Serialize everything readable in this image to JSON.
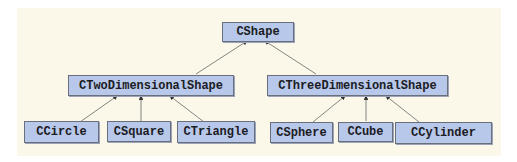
{
  "diagram": {
    "type": "class-hierarchy",
    "colors": {
      "background": "#fbf8ea",
      "node_fill": "#b8c8ea",
      "node_border": "#6a6f7e",
      "edge": "#555555"
    },
    "nodes": [
      {
        "id": "cshape",
        "label": "CShape"
      },
      {
        "id": "ctwo",
        "label": "CTwoDimensionalShape"
      },
      {
        "id": "cthree",
        "label": "CThreeDimensionalShape"
      },
      {
        "id": "ccircle",
        "label": "CCircle"
      },
      {
        "id": "csquare",
        "label": "CSquare"
      },
      {
        "id": "ctriangle",
        "label": "CTriangle"
      },
      {
        "id": "csphere",
        "label": "CSphere"
      },
      {
        "id": "ccube",
        "label": "CCube"
      },
      {
        "id": "ccylinder",
        "label": "CCylinder"
      }
    ],
    "edges": [
      {
        "from": "ctwo",
        "to": "cshape",
        "kind": "inherits"
      },
      {
        "from": "cthree",
        "to": "cshape",
        "kind": "inherits"
      },
      {
        "from": "ccircle",
        "to": "ctwo",
        "kind": "inherits"
      },
      {
        "from": "csquare",
        "to": "ctwo",
        "kind": "inherits"
      },
      {
        "from": "ctriangle",
        "to": "ctwo",
        "kind": "inherits"
      },
      {
        "from": "csphere",
        "to": "cthree",
        "kind": "inherits"
      },
      {
        "from": "ccube",
        "to": "cthree",
        "kind": "inherits"
      },
      {
        "from": "ccylinder",
        "to": "cthree",
        "kind": "inherits"
      }
    ]
  }
}
